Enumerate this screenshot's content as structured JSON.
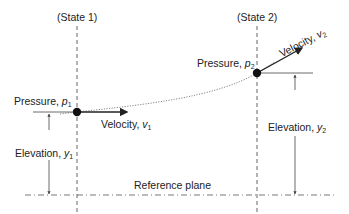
{
  "diagram": {
    "states": [
      {
        "label": "(State 1)",
        "x": 77
      },
      {
        "label": "(State 2)",
        "x": 257
      }
    ],
    "point1": {
      "pressure_label": "Pressure,",
      "pressure_symbol": "p",
      "pressure_sub": "1",
      "velocity_label": "Velocity,",
      "velocity_symbol": "v",
      "velocity_sub": "1",
      "elevation_label": "Elevation,",
      "elevation_symbol": "y",
      "elevation_sub": "1"
    },
    "point2": {
      "pressure_label": "Pressure,",
      "pressure_symbol": "p",
      "pressure_sub": "2",
      "velocity_label": "Velocity,",
      "velocity_symbol": "v",
      "velocity_sub": "2",
      "elevation_label": "Elevation,",
      "elevation_symbol": "y",
      "elevation_sub": "2"
    },
    "reference_plane": "Reference plane",
    "colors": {
      "line": "#222222",
      "guide": "#555555",
      "flow": "#777777"
    }
  }
}
